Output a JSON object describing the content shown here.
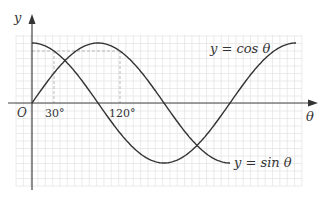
{
  "chart_data": {
    "type": "line",
    "title": "",
    "xlabel": "θ",
    "ylabel": "y",
    "origin_label": "O",
    "x_unit": "degrees",
    "xlim": [
      0,
      360
    ],
    "ylim": [
      -1,
      1
    ],
    "grid": true,
    "tick_labels": [
      "30°",
      "120°"
    ],
    "ticks": [
      30,
      120
    ],
    "series": [
      {
        "name": "y = cos θ",
        "function": "cos",
        "x_range": [
          0,
          360
        ],
        "x": [
          0,
          30,
          60,
          90,
          120,
          150,
          180,
          210,
          240,
          270,
          300,
          330,
          360
        ],
        "values": [
          1,
          0.866,
          0.5,
          0,
          -0.5,
          -0.866,
          -1,
          -0.866,
          -0.5,
          0,
          0.5,
          0.866,
          1
        ]
      },
      {
        "name": "y = sin θ",
        "function": "sin",
        "x_range": [
          0,
          270
        ],
        "x": [
          0,
          30,
          60,
          90,
          120,
          150,
          180,
          210,
          240,
          270
        ],
        "values": [
          0,
          0.5,
          0.866,
          1,
          0.866,
          0.5,
          0,
          -0.5,
          -0.866,
          -1
        ]
      }
    ],
    "annotations": [
      "dashed guide lines at θ=30° and θ=120° up to y = 0.866"
    ]
  },
  "labels": {
    "y_axis": "y",
    "x_axis": "θ",
    "origin": "O",
    "tick_30": "30°",
    "tick_120": "120°",
    "cos_label": "y = cos θ",
    "sin_label": "y = sin θ"
  }
}
